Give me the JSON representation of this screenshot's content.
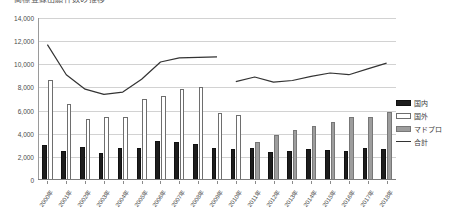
{
  "chart_data": {
    "type": "bar",
    "title": "商標登録出願件数の推移",
    "xlabel": "",
    "ylabel": "",
    "ylim": [
      0,
      14000
    ],
    "ytick_step": 2000,
    "ytick_labels": [
      "0",
      "2,000",
      "4,000",
      "6,000",
      "8,000",
      "10,000",
      "12,000",
      "14,000"
    ],
    "grid": true,
    "legend_position": "right",
    "categories": [
      "2000年",
      "2001年",
      "2002年",
      "2003年",
      "2004年",
      "2005年",
      "2006年",
      "2007年",
      "2008年",
      "2009年",
      "2010年",
      "2011年",
      "2012年",
      "2013年",
      "2014年",
      "2015年",
      "2016年",
      "2017年",
      "2018年"
    ],
    "series": [
      {
        "name": "国内",
        "type": "bar",
        "color": "#1d1d1d",
        "values": [
          3050,
          2550,
          2850,
          2350,
          2750,
          2800,
          3400,
          3250,
          3150,
          2800,
          2700,
          2750,
          2450,
          2500,
          2650,
          2600,
          2500,
          2750,
          2700
        ]
      },
      {
        "name": "国外",
        "type": "bar",
        "color": "#ffffff",
        "values": [
          8650,
          6550,
          5300,
          5450,
          5450,
          7000,
          7300,
          7900,
          8050,
          5800,
          5600,
          null,
          null,
          null,
          null,
          null,
          null,
          null,
          null
        ]
      },
      {
        "name": "マドプロ",
        "type": "bar",
        "color": "#9d9d9d",
        "values": [
          null,
          null,
          null,
          null,
          null,
          null,
          null,
          null,
          null,
          null,
          400,
          3300,
          3900,
          4350,
          4700,
          5000,
          5450,
          5450,
          5900
        ]
      },
      {
        "name": "合計",
        "type": "line",
        "color": "#333333",
        "values": [
          11700,
          9100,
          7850,
          7400,
          7600,
          8700,
          10200,
          10550,
          10600,
          10650,
          8500,
          8900,
          8450,
          8600,
          8950,
          9250,
          9100,
          9600,
          10100
        ]
      }
    ]
  },
  "legend": {
    "items": [
      {
        "label": "国内",
        "swatch": "kokunai"
      },
      {
        "label": "国外",
        "swatch": "kokugai"
      },
      {
        "label": "マドプロ",
        "swatch": "madopro"
      },
      {
        "label": "合計",
        "swatch": "line"
      }
    ]
  }
}
